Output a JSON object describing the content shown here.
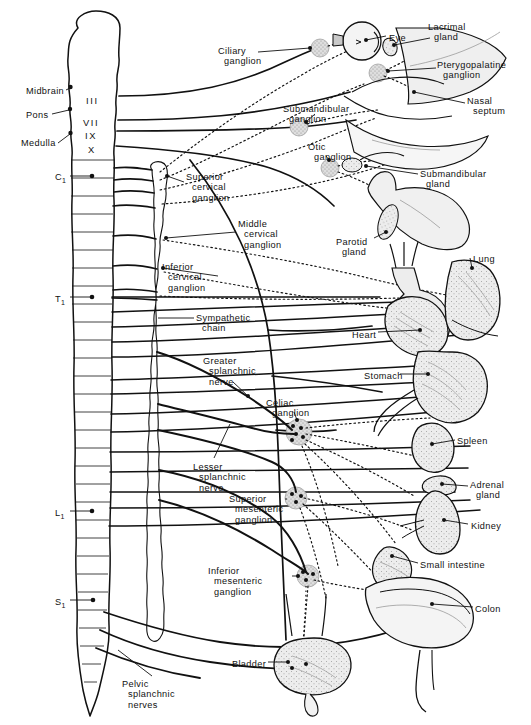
{
  "figure": {
    "colors": {
      "ink": "#111111",
      "paper": "#ffffff",
      "ganglion_fill": "#cfcfcf",
      "organ_fill": "#e8e8e8",
      "organ_fill_light": "#f2f2f2"
    }
  },
  "cns_labels": [
    {
      "name": "midbrain",
      "text": "Midbrain",
      "x": 26,
      "y": 86,
      "align": "left"
    },
    {
      "name": "pons",
      "text": "Pons",
      "x": 26,
      "y": 110,
      "align": "left"
    },
    {
      "name": "medulla",
      "text": "Medulla",
      "x": 21,
      "y": 138,
      "align": "left"
    }
  ],
  "spinal_levels": [
    {
      "name": "c1",
      "letter": "C",
      "index": "1",
      "x": 55,
      "y": 172
    },
    {
      "name": "t1",
      "letter": "T",
      "index": "1",
      "x": 55,
      "y": 294
    },
    {
      "name": "l1",
      "letter": "L",
      "index": "1",
      "x": 55,
      "y": 508
    },
    {
      "name": "s1",
      "letter": "S",
      "index": "1",
      "x": 55,
      "y": 597
    }
  ],
  "cranial_nerves": [
    {
      "name": "cn-iii",
      "numeral": "III",
      "x": 86,
      "y": 95
    },
    {
      "name": "cn-vii",
      "numeral": "VII",
      "x": 83,
      "y": 117
    },
    {
      "name": "cn-ix",
      "numeral": "IX",
      "x": 85,
      "y": 130
    },
    {
      "name": "cn-x",
      "numeral": "X",
      "x": 88,
      "y": 144
    }
  ],
  "ganglia_labels": [
    {
      "name": "ciliary-ganglion",
      "line1": "Ciliary",
      "line2": "ganglion",
      "line3": "",
      "x": 218,
      "y": 46,
      "align": "left"
    },
    {
      "name": "pterygopalatine-ganglion",
      "line1": "Pterygopalatine",
      "line2": "ganglion",
      "line3": "",
      "x": 437,
      "y": 60,
      "align": "left"
    },
    {
      "name": "submandibular-ganglion",
      "line1": "Submandibular",
      "line2": "ganglion",
      "line3": "",
      "x": 283,
      "y": 104,
      "align": "left"
    },
    {
      "name": "otic-ganglion",
      "line1": "Otic",
      "line2": "ganglion",
      "line3": "",
      "x": 308,
      "y": 142,
      "align": "left"
    },
    {
      "name": "superior-cervical-ganglion",
      "line1": "Superior",
      "line2": "cervical",
      "line3": "ganglion",
      "x": 186,
      "y": 172,
      "align": "left"
    },
    {
      "name": "middle-cervical-ganglion",
      "line1": "Middle",
      "line2": "cervical",
      "line3": "ganglion",
      "x": 238,
      "y": 219,
      "align": "left"
    },
    {
      "name": "inferior-cervical-ganglion",
      "line1": "Inferior",
      "line2": "cervical",
      "line3": "ganglion",
      "x": 162,
      "y": 262,
      "align": "left"
    },
    {
      "name": "celiac-ganglion",
      "line1": "Celiac",
      "line2": "ganglion",
      "line3": "",
      "x": 266,
      "y": 398,
      "align": "left"
    },
    {
      "name": "superior-mesenteric-ganglion",
      "line1": "Superior",
      "line2": "mesenteric",
      "line3": "ganglion",
      "x": 229,
      "y": 494,
      "align": "left"
    },
    {
      "name": "inferior-mesenteric-ganglion",
      "line1": "Inferior",
      "line2": "mesenteric",
      "line3": "ganglion",
      "x": 208,
      "y": 566,
      "align": "left"
    }
  ],
  "nerve_labels": [
    {
      "name": "sympathetic-chain",
      "line1": "Sympathetic",
      "line2": "chain",
      "line3": "",
      "x": 196,
      "y": 313,
      "align": "left"
    },
    {
      "name": "greater-splanchnic-nerve",
      "line1": "Greater",
      "line2": "splanchnic",
      "line3": "nerve",
      "x": 203,
      "y": 356,
      "align": "left"
    },
    {
      "name": "lesser-splanchnic-nerve",
      "line1": "Lesser",
      "line2": "splanchnic",
      "line3": "nerve",
      "x": 193,
      "y": 462,
      "align": "left"
    },
    {
      "name": "pelvic-splanchnic-nerves",
      "line1": "Pelvic",
      "line2": "splanchnic",
      "line3": "nerves",
      "x": 122,
      "y": 679,
      "align": "left"
    }
  ],
  "organ_labels": [
    {
      "name": "eye",
      "line1": "Eye",
      "line2": "",
      "x": 389,
      "y": 33,
      "align": "left"
    },
    {
      "name": "lacrimal-gland",
      "line1": "Lacrimal",
      "line2": "gland",
      "x": 428,
      "y": 22,
      "align": "left"
    },
    {
      "name": "nasal-septum",
      "line1": "Nasal",
      "line2": "septum",
      "x": 467,
      "y": 96,
      "align": "left"
    },
    {
      "name": "submandibular-gland",
      "line1": "Submandibular",
      "line2": "gland",
      "x": 420,
      "y": 169,
      "align": "left"
    },
    {
      "name": "parotid-gland",
      "line1": "Parotid",
      "line2": "gland",
      "x": 336,
      "y": 237,
      "align": "left"
    },
    {
      "name": "lung",
      "line1": "Lung",
      "line2": "",
      "x": 473,
      "y": 254,
      "align": "left"
    },
    {
      "name": "heart",
      "line1": "Heart",
      "line2": "",
      "x": 352,
      "y": 330,
      "align": "left"
    },
    {
      "name": "stomach",
      "line1": "Stomach",
      "line2": "",
      "x": 364,
      "y": 371,
      "align": "left"
    },
    {
      "name": "spleen",
      "line1": "Spleen",
      "line2": "",
      "x": 457,
      "y": 436,
      "align": "left"
    },
    {
      "name": "adrenal-gland",
      "line1": "Adrenal",
      "line2": "gland",
      "x": 470,
      "y": 480,
      "align": "left"
    },
    {
      "name": "kidney",
      "line1": "Kidney",
      "line2": "",
      "x": 471,
      "y": 521,
      "align": "left"
    },
    {
      "name": "small-intestine",
      "line1": "Small intestine",
      "line2": "",
      "x": 420,
      "y": 560,
      "align": "left"
    },
    {
      "name": "colon",
      "line1": "Colon",
      "line2": "",
      "x": 475,
      "y": 604,
      "align": "left"
    },
    {
      "name": "bladder",
      "line1": "Bladder",
      "line2": "",
      "x": 232,
      "y": 659,
      "align": "left"
    }
  ]
}
